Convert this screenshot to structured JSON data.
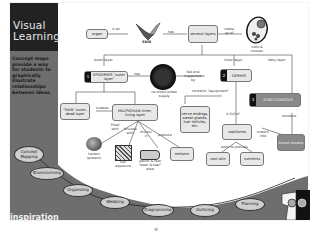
{
  "sidebar": {
    "title_line1": "Visual",
    "title_line2": "Learning",
    "description": "Concept maps provide a way for students to graphically illustrate relationships between ideas.",
    "brand": "inspiration"
  },
  "diagram": {
    "nodes": {
      "organ": "organ",
      "skin": "SKIN",
      "several_layers": "several layers",
      "cells": "cells & tissues",
      "epidermis_num": "1",
      "epidermis": "EPIDERMIS \"outer layer\"",
      "no_blood": "no direct blood supply",
      "dermis_num": "2",
      "dermis": "DERMIS",
      "subcutaneous_num": "3",
      "subcutaneous": "SUBCUTANEOUS",
      "dead_layer": "\"SKIN\" outer, dead layer",
      "malpighian": "MALPIGHIAN inner, living layer",
      "nerve_endings": "nerve endings, sweat glands, hair follicles, etc.",
      "capillaries": "capillaries",
      "blood_vessels": "blood vessels",
      "keratin": "keratin (protein)",
      "sun": "sun exposure",
      "palms": "palms & feet \"wear & tear\" area",
      "melanin": "melanin",
      "cool_skin": "cool skin",
      "nutrients": "nutrients"
    },
    "links": {
      "is_an": "is an",
      "has": "has",
      "made_up_of": "made up of",
      "outer_layer": "outer layer",
      "inner_layer": "inner layer",
      "fatty_layer": "fatty layer",
      "has2": "has",
      "fed_supported": "fed and supported by",
      "contains_equipment": "contains \"equipment\"",
      "is_full_of": "is full of",
      "contains": "contains",
      "creates": "creates",
      "filled_with": "filled with",
      "toughened": "bruised with",
      "thicker_in": "thicker in",
      "produce": "produce",
      "branch_into": "branch into",
      "work_to_provide": "work to provide"
    }
  },
  "steps": [
    "Concept Mapping",
    "Brainstorming",
    "Organizing",
    "Webbing",
    "Diagramming",
    "Outlining",
    "Planning"
  ],
  "page_number": "⊘"
}
